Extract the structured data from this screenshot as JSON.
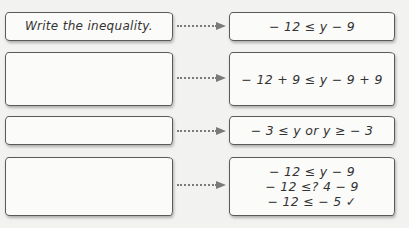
{
  "rows": [
    {
      "left": {
        "text": "Write the inequality."
      },
      "right": {
        "lines": [
          "− 12 ≤ y − 9"
        ]
      }
    },
    {
      "left": {
        "text": ""
      },
      "right": {
        "lines": [
          "− 12 + 9 ≤ y − 9 + 9"
        ]
      }
    },
    {
      "left": {
        "text": ""
      },
      "right": {
        "lines": [
          "− 3 ≤ y or y ≥ − 3"
        ]
      }
    },
    {
      "left": {
        "text": ""
      },
      "right": {
        "lines": [
          "− 12 ≤ y − 9",
          "− 12 ≤? 4 − 9",
          "− 12 ≤ − 5 ✓"
        ]
      }
    }
  ],
  "colors": {
    "background": "#f2f2f1",
    "box_fill": "#fbfbfa",
    "box_border": "#5a5a5a",
    "arrow": "#7a7a7a",
    "text": "#333333"
  }
}
